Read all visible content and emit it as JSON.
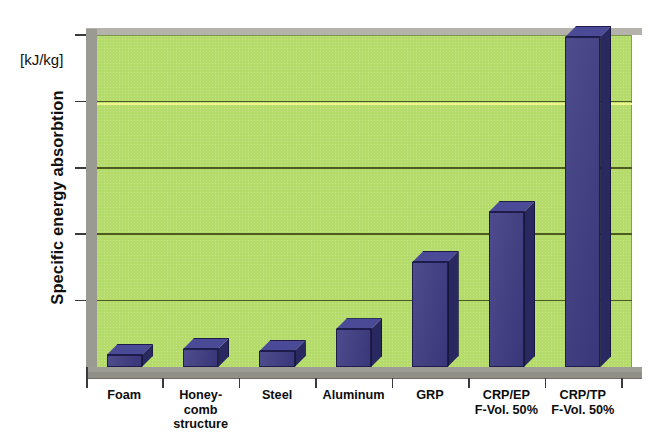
{
  "chart_data": {
    "type": "bar",
    "title": "",
    "subtitle": "",
    "xlabel": "",
    "ylabel": "Specific energy absorbtion",
    "unit_label": "[kJ/kg]",
    "categories": [
      "Foam",
      "Honey-\ncomb\nstructure",
      "Steel",
      "Aluminum",
      "GRP",
      "CRP/EP\nF-Vol. 50%",
      "CRP/TP\nF-Vol. 50%"
    ],
    "values": [
      3.6,
      5.4,
      4.8,
      11.4,
      31.6,
      46.7,
      99.4
    ],
    "value_unit": "relative % of axis height",
    "ylim": [
      0,
      100
    ],
    "y_tick_values": [
      0,
      20,
      40,
      60,
      80,
      100
    ],
    "y_tick_labels": [
      "",
      "",
      "",
      "",
      "",
      ""
    ],
    "gridlines": true,
    "gridline_count": 4,
    "legend": "none",
    "legend_position": "none",
    "style": "3d-bar",
    "colors": {
      "plot_background": "#b5db6b",
      "gridline": "#4d5a22",
      "bar_front": "#3c3a80",
      "bar_side": "#2a2860",
      "bar_top": "#4b4a96",
      "wall": "#9a9a92",
      "floor": "#9c9c94",
      "text": "#101010",
      "scan_artifact": "#f2f58a"
    }
  }
}
